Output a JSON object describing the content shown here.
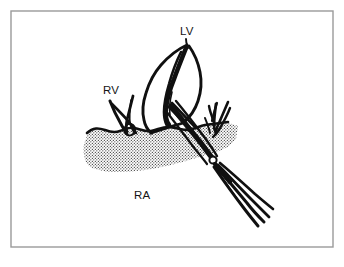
{
  "figure": {
    "kind": "line-drawing-medical-illustration",
    "background_color": "#ffffff",
    "ink_color": "#101010",
    "border": {
      "color": "#9a9a9a",
      "stroke_width": 1.4,
      "x": 11,
      "y": 11,
      "width": 322,
      "height": 236
    }
  },
  "labels": [
    {
      "id": "lv",
      "text": "LV",
      "meaning": "left-ventricle",
      "x": 180,
      "y": 35
    },
    {
      "id": "rv",
      "text": "RV",
      "meaning": "right-ventricle",
      "x": 103,
      "y": 94
    },
    {
      "id": "ra",
      "text": "RA",
      "meaning": "right-atrium",
      "x": 134,
      "y": 199
    }
  ],
  "stipple": {
    "name": "myocardial-tissue-stipple",
    "dot_color": "#2a2a2a",
    "dot_radius": 0.62,
    "spacing": 3.0,
    "description": "halftone dot fill of the atrial tissue mass"
  },
  "instrument": {
    "name": "surgical-forceps",
    "handle_count": 4,
    "has_hinge_screw": true,
    "entry_direction": "lower-right"
  },
  "structures": {
    "leaflet": "valve-leaflet-cusp",
    "chordae_left": "right-ventricle-chordae-branches",
    "chordae_right": "right-side-chordae-branches",
    "tissue_surface": "undulating-tissue-surface-line"
  }
}
